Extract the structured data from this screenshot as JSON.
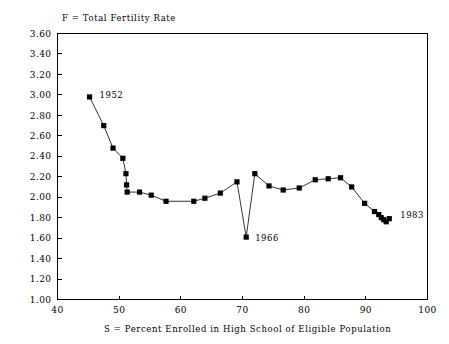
{
  "chart_data": {
    "type": "scatter",
    "title": "F = Total Fertility Rate",
    "xlabel": "S = Percent Enrolled in High School of Eligible Population",
    "ylabel": "F = Total Fertility Rate",
    "xlim": [
      40,
      100
    ],
    "ylim": [
      1.0,
      3.6
    ],
    "xticks": [
      40,
      50,
      60,
      70,
      80,
      90,
      100
    ],
    "yticks": [
      "1.00",
      "1.20",
      "1.40",
      "1.60",
      "1.80",
      "2.00",
      "2.20",
      "2.40",
      "2.60",
      "2.80",
      "3.00",
      "3.20",
      "3.40",
      "3.60"
    ],
    "grid": false,
    "legend": null,
    "connected": true,
    "marker": "filled-square",
    "series": [
      {
        "name": "Total Fertility Rate vs High School Enrollment",
        "x": [
          45.2,
          47.5,
          49.0,
          50.6,
          51.1,
          51.2,
          51.3,
          53.3,
          55.2,
          57.6,
          62.1,
          63.9,
          66.4,
          69.1,
          70.6,
          72.0,
          74.3,
          76.6,
          79.2,
          81.8,
          83.9,
          85.9,
          87.7,
          89.8,
          91.4,
          92.1,
          92.5,
          92.9,
          93.3,
          93.8
        ],
        "y": [
          2.98,
          2.7,
          2.48,
          2.38,
          2.23,
          2.12,
          2.05,
          2.05,
          2.02,
          1.96,
          1.96,
          1.99,
          2.04,
          2.15,
          1.61,
          2.23,
          2.11,
          2.07,
          2.09,
          2.17,
          2.18,
          2.19,
          2.1,
          1.94,
          1.86,
          1.83,
          1.8,
          1.78,
          1.76,
          1.79
        ]
      }
    ],
    "annotations": [
      {
        "text": "1952",
        "x": 45.2,
        "y": 2.98,
        "dx": 10,
        "dy": 1
      },
      {
        "text": "1966",
        "x": 70.6,
        "y": 1.61,
        "dx": 9,
        "dy": 4
      },
      {
        "text": "1983",
        "x": 93.8,
        "y": 1.79,
        "dx": 11,
        "dy": -1
      }
    ]
  },
  "colors": {
    "marker": "#000000",
    "line": "#000000",
    "axis": "#000000",
    "background": "#ffffff"
  }
}
